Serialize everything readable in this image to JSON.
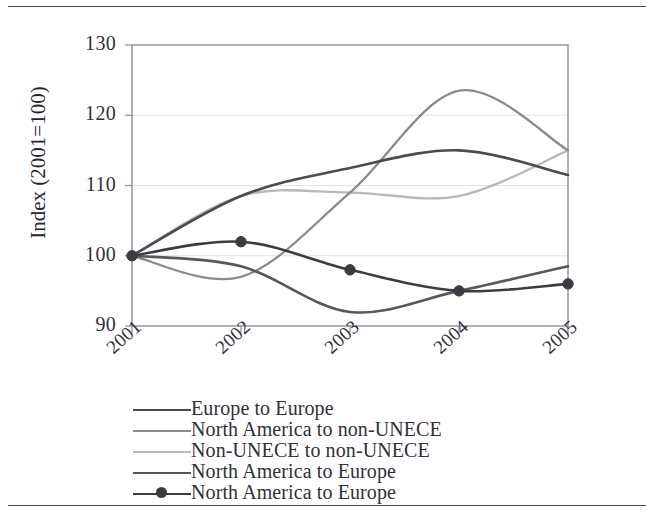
{
  "figure": {
    "top_rule": "horizontal-rule",
    "bottom_rule": "horizontal-rule"
  },
  "chart_data": {
    "type": "line",
    "title": "",
    "xlabel": "",
    "ylabel": "Index (2001=100)",
    "x": [
      2001,
      2002,
      2003,
      2004,
      2005
    ],
    "xtick_labels": [
      "2001",
      "2002",
      "2003",
      "2004",
      "2005"
    ],
    "ytick_labels": [
      "130",
      "120",
      "110",
      "100",
      "90"
    ],
    "ylim": [
      90,
      130
    ],
    "ytick_step": 10,
    "grid": "horizontal",
    "legend_position": "below-plot",
    "series": [
      {
        "name": "Europe to Europe",
        "color": "#4b4b52",
        "width": 2.6,
        "markers": false,
        "values": [
          100,
          108.5,
          112.5,
          115,
          111.5
        ]
      },
      {
        "name": "North America to non-UNECE",
        "color": "#8a8a8f",
        "width": 2.3,
        "markers": false,
        "values": [
          100,
          97,
          109,
          123.5,
          115
        ]
      },
      {
        "name": "Non-UNECE to non-UNECE",
        "color": "#b9b9bd",
        "width": 2.3,
        "markers": false,
        "values": [
          100,
          108.5,
          109,
          108.5,
          115
        ]
      },
      {
        "name": "North America to Europe",
        "color": "#57575e",
        "width": 2.6,
        "markers": false,
        "values": [
          100,
          98.5,
          92,
          95,
          98.5
        ]
      },
      {
        "name": "North America to Europe",
        "color": "#3b3b42",
        "width": 2.6,
        "markers": true,
        "values": [
          100,
          102,
          98,
          95,
          96
        ]
      }
    ],
    "axis_color": "#8f8f96",
    "grid_color": "#e2e2e6"
  }
}
